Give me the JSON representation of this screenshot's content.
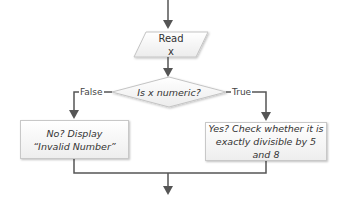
{
  "flowchart": {
    "read_node": {
      "line1": "Read",
      "line2": "x"
    },
    "decision_node": {
      "label": "Is x numeric?"
    },
    "false_branch": {
      "label": "False"
    },
    "true_branch": {
      "label": "True"
    },
    "false_box": {
      "line1": "No? Display",
      "line2": "“Invalid Number”"
    },
    "true_box": {
      "line1": "Yes? Check whether it is",
      "line2": "exactly divisible by 5 and 8"
    }
  },
  "colors": {
    "line": "#555555",
    "shape_border": "#c8c8c8",
    "shape_fill_top": "#ffffff",
    "shape_fill_bottom": "#eeeeee",
    "text": "#333333"
  }
}
